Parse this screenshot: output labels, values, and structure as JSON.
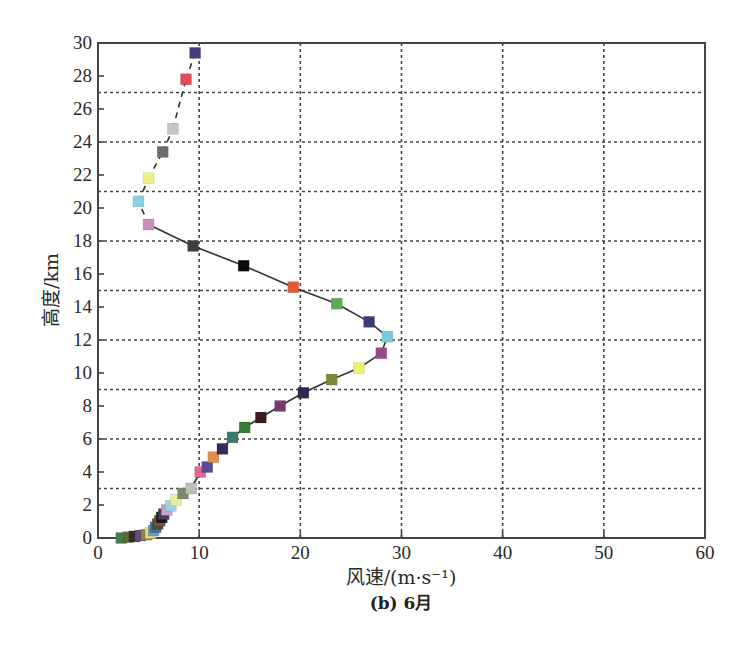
{
  "chart_data": {
    "type": "line",
    "subtype": "scatter-profile",
    "title": "(b) 6月",
    "xlabel": "风速/(m·s⁻¹)",
    "ylabel": "高度/km",
    "xlim": [
      0,
      60
    ],
    "ylim": [
      0,
      30
    ],
    "x_ticks": [
      0,
      10,
      20,
      30,
      40,
      50,
      60
    ],
    "y_ticks": [
      0,
      2,
      4,
      6,
      8,
      10,
      12,
      14,
      16,
      18,
      20,
      22,
      24,
      26,
      28,
      30
    ],
    "x_grid": [
      10,
      20,
      30,
      40,
      50
    ],
    "y_grid": [
      3,
      6,
      9,
      12,
      15,
      18,
      21,
      24,
      27
    ],
    "grid": true,
    "legend": null,
    "marker": "square",
    "series": [
      {
        "name": "June wind speed profile",
        "points": [
          {
            "x": 2.3,
            "y": 0.0,
            "color": "#4a7a4a"
          },
          {
            "x": 3.0,
            "y": 0.05,
            "color": "#5a6a3a"
          },
          {
            "x": 3.6,
            "y": 0.1,
            "color": "#3a2a2a"
          },
          {
            "x": 4.2,
            "y": 0.15,
            "color": "#6a4a7a"
          },
          {
            "x": 4.8,
            "y": 0.2,
            "color": "#8a8a3a"
          },
          {
            "x": 5.2,
            "y": 0.3,
            "color": "#e8e070"
          },
          {
            "x": 5.5,
            "y": 0.45,
            "color": "#6a9ad0"
          },
          {
            "x": 5.7,
            "y": 0.65,
            "color": "#4a6a9a"
          },
          {
            "x": 5.9,
            "y": 0.85,
            "color": "#3a5a3a"
          },
          {
            "x": 6.1,
            "y": 1.05,
            "color": "#8a4a4a"
          },
          {
            "x": 6.3,
            "y": 1.25,
            "color": "#1a1a1a"
          },
          {
            "x": 6.5,
            "y": 1.45,
            "color": "#4a3a5a"
          },
          {
            "x": 6.8,
            "y": 1.7,
            "color": "#c8a0c8"
          },
          {
            "x": 7.2,
            "y": 1.95,
            "color": "#a0d0e8"
          },
          {
            "x": 7.7,
            "y": 2.3,
            "color": "#e8f0a0"
          },
          {
            "x": 8.4,
            "y": 2.7,
            "color": "#7a8a6a"
          },
          {
            "x": 9.2,
            "y": 3.0,
            "color": "#b8c0b8"
          },
          {
            "x": 10.1,
            "y": 4.0,
            "color": "#e06a8a"
          },
          {
            "x": 10.8,
            "y": 4.3,
            "color": "#5a4a9a"
          },
          {
            "x": 11.4,
            "y": 4.9,
            "color": "#e0904a"
          },
          {
            "x": 12.3,
            "y": 5.4,
            "color": "#3a2a5a"
          },
          {
            "x": 13.3,
            "y": 6.1,
            "color": "#3a7a6a"
          },
          {
            "x": 14.5,
            "y": 6.7,
            "color": "#3a7a3a"
          },
          {
            "x": 16.1,
            "y": 7.3,
            "color": "#3a1a1a"
          },
          {
            "x": 18.0,
            "y": 8.0,
            "color": "#7a3a6a"
          },
          {
            "x": 20.3,
            "y": 8.8,
            "color": "#2a2a4a"
          },
          {
            "x": 23.1,
            "y": 9.6,
            "color": "#7a8a3a"
          },
          {
            "x": 25.8,
            "y": 10.3,
            "color": "#f0f070"
          },
          {
            "x": 28.0,
            "y": 11.2,
            "color": "#9a4a8a"
          },
          {
            "x": 28.6,
            "y": 12.2,
            "color": "#7acad8"
          },
          {
            "x": 26.8,
            "y": 13.1,
            "color": "#3a3a7a"
          },
          {
            "x": 23.6,
            "y": 14.2,
            "color": "#5aaa5a"
          },
          {
            "x": 19.3,
            "y": 15.2,
            "color": "#e05a3a"
          },
          {
            "x": 14.4,
            "y": 16.5,
            "color": "#0a0a0a"
          },
          {
            "x": 9.4,
            "y": 17.7,
            "color": "#3a403a"
          },
          {
            "x": 5.0,
            "y": 19.0,
            "color": "#c890b8"
          },
          {
            "x": 4.0,
            "y": 20.4,
            "color": "#8ad0e0"
          },
          {
            "x": 5.0,
            "y": 21.8,
            "color": "#f0f080"
          },
          {
            "x": 6.4,
            "y": 23.4,
            "color": "#6a6e6a"
          },
          {
            "x": 7.4,
            "y": 24.8,
            "color": "#c0c8c4"
          },
          {
            "x": 8.7,
            "y": 27.8,
            "color": "#e04a5a"
          },
          {
            "x": 9.6,
            "y": 29.4,
            "color": "#4a3a7a"
          }
        ]
      }
    ]
  },
  "labels": {
    "ylabel": "高度/km",
    "xlabel": "风速/(m·s⁻¹)",
    "caption": "(b) 6月"
  }
}
